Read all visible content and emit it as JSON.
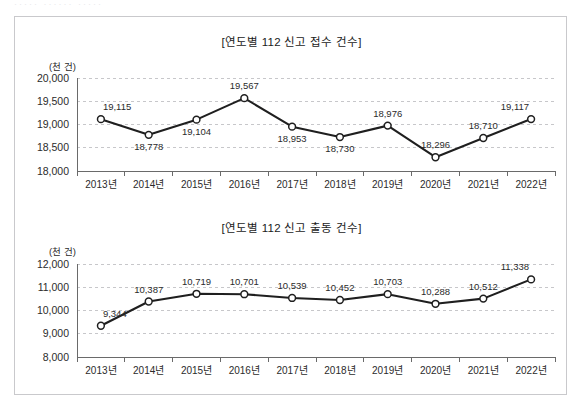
{
  "document": {
    "top_clipped_text": "·····  ······   ·····"
  },
  "charts": [
    {
      "id": "received",
      "title": "[연도별 112 신고 접수 건수]",
      "unit_label": "(천 건)",
      "chart_data": {
        "type": "line",
        "title": "[연도별 112 신고 접수 건수]",
        "xlabel": "",
        "ylabel": "(천 건)",
        "ylim": [
          18000,
          20000
        ],
        "yticks": [
          18000,
          18500,
          19000,
          19500,
          20000
        ],
        "ytick_labels": [
          "18,000",
          "18,500",
          "19,000",
          "19,500",
          "20,000"
        ],
        "grid": true,
        "legend": "none",
        "categories": [
          "2013년",
          "2014년",
          "2015년",
          "2016년",
          "2017년",
          "2018년",
          "2019년",
          "2020년",
          "2021년",
          "2022년"
        ],
        "values": [
          19115,
          18778,
          19104,
          19567,
          18953,
          18730,
          18976,
          18296,
          18710,
          19117
        ],
        "data_labels": [
          "19,115",
          "18,778",
          "19,104",
          "19,567",
          "18,953",
          "18,730",
          "18,976",
          "18,296",
          "18,710",
          "19,117"
        ],
        "label_positions": [
          "above",
          "below",
          "below",
          "above",
          "below",
          "below",
          "above",
          "above",
          "above",
          "above"
        ]
      }
    },
    {
      "id": "dispatched",
      "title": "[연도별 112 신고 출동 건수]",
      "unit_label": "(천 건)",
      "chart_data": {
        "type": "line",
        "title": "[연도별 112 신고 출동 건수]",
        "xlabel": "",
        "ylabel": "(천 건)",
        "ylim": [
          8000,
          12000
        ],
        "yticks": [
          8000,
          9000,
          10000,
          11000,
          12000
        ],
        "ytick_labels": [
          "8,000",
          "9,000",
          "10,000",
          "11,000",
          "12,000"
        ],
        "grid": true,
        "legend": "none",
        "categories": [
          "2013년",
          "2014년",
          "2015년",
          "2016년",
          "2017년",
          "2018년",
          "2019년",
          "2020년",
          "2021년",
          "2022년"
        ],
        "values": [
          9344,
          10387,
          10719,
          10701,
          10539,
          10452,
          10703,
          10288,
          10512,
          11338
        ],
        "data_labels": [
          "9,344",
          "10,387",
          "10,719",
          "10,701",
          "10,539",
          "10,452",
          "10,703",
          "10,288",
          "10,512",
          "11,338"
        ],
        "label_positions": [
          "above",
          "above",
          "above",
          "above",
          "above",
          "above",
          "above",
          "above",
          "above",
          "above"
        ]
      }
    }
  ],
  "colors": {
    "line": "#1f1f1f",
    "marker_fill": "#ffffff",
    "grid": "#b9b9bd",
    "axis": "#6a6a6a",
    "frame": "#c9c9cc",
    "text": "#2b2b2b"
  }
}
